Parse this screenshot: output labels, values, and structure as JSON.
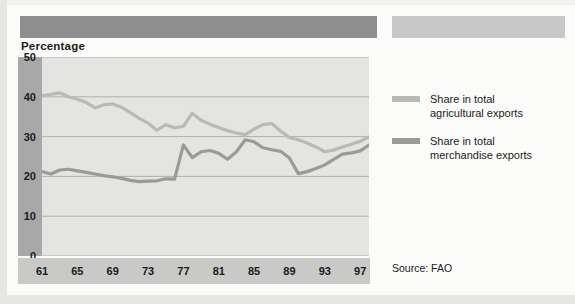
{
  "page": {
    "axis_title": "Percentage",
    "source": "Source: FAO"
  },
  "legend": {
    "items": [
      {
        "label_line1": "Share in total",
        "label_line2": "agricultural exports",
        "color": "#b9b9b7"
      },
      {
        "label_line1": "Share in total",
        "label_line2": "merchandise exports",
        "color": "#9a9a98"
      }
    ]
  },
  "colors": {
    "title_bar_dark": "#8e8e8e",
    "title_bar_light": "#c7c7c7",
    "axis_band": "#a8a8a8",
    "xaxis_band": "#c9c9c7",
    "plot_bg": "#e4e4e2",
    "gridline": "#b0b0ae",
    "series_agricultural": "#b9b9b7",
    "series_merchandise": "#9a9a98"
  },
  "chart_data": {
    "type": "line",
    "title": "Percentage",
    "xlabel": "",
    "ylabel": "Percentage",
    "ylim": [
      0,
      50
    ],
    "yticks": [
      0,
      10,
      20,
      30,
      40,
      50
    ],
    "xticks": [
      "61",
      "65",
      "69",
      "73",
      "77",
      "81",
      "85",
      "89",
      "93",
      "97"
    ],
    "xlim": [
      1961,
      1998
    ],
    "grid": true,
    "legend_position": "right",
    "annotations": [
      "Source: FAO"
    ],
    "x": [
      1961,
      1962,
      1963,
      1964,
      1965,
      1966,
      1967,
      1968,
      1969,
      1970,
      1971,
      1972,
      1973,
      1974,
      1975,
      1976,
      1977,
      1978,
      1979,
      1980,
      1981,
      1982,
      1983,
      1984,
      1985,
      1986,
      1987,
      1988,
      1989,
      1990,
      1991,
      1992,
      1993,
      1994,
      1995,
      1996,
      1997,
      1998
    ],
    "series": [
      {
        "name": "Share in total agricultural exports",
        "color": "#b9b9b7",
        "values": [
          40.3,
          40.6,
          41.0,
          40.0,
          39.4,
          38.6,
          37.2,
          38.0,
          38.2,
          37.4,
          36.0,
          34.6,
          33.4,
          31.6,
          33.0,
          32.2,
          32.6,
          35.9,
          34.1,
          33.1,
          32.3,
          31.5,
          30.9,
          30.5,
          31.9,
          33.0,
          33.3,
          31.4,
          29.7,
          29.2,
          28.4,
          27.4,
          26.2,
          26.6,
          27.4,
          28.1,
          28.8,
          29.9
        ]
      },
      {
        "name": "Share in total merchandise exports",
        "color": "#9a9a98",
        "values": [
          21.2,
          20.6,
          21.6,
          21.8,
          21.4,
          21.0,
          20.6,
          20.2,
          19.9,
          19.5,
          19.0,
          18.7,
          18.8,
          18.9,
          19.4,
          19.3,
          27.9,
          24.7,
          26.2,
          26.5,
          25.8,
          24.3,
          26.2,
          29.2,
          28.7,
          27.2,
          26.7,
          26.3,
          24.6,
          20.7,
          21.2,
          22.0,
          22.9,
          24.3,
          25.6,
          25.9,
          26.4,
          27.9
        ]
      }
    ]
  }
}
